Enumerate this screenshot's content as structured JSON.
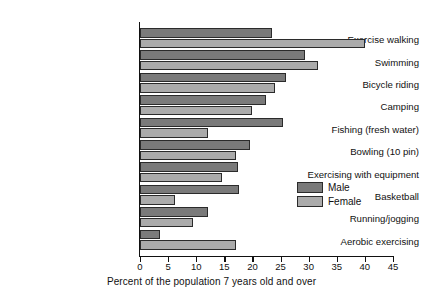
{
  "chart_data": {
    "type": "bar",
    "orientation": "horizontal",
    "title": "",
    "xlabel": "Percent of the population 7 years old and over",
    "ylabel": "",
    "xlim": [
      0,
      45
    ],
    "xticks": [
      0,
      5,
      10,
      15,
      20,
      25,
      30,
      35,
      40,
      45
    ],
    "grid": false,
    "legend_position": "center-right",
    "categories": [
      "Exercise walking",
      "Swimming",
      "Bicycle riding",
      "Camping",
      "Fishing (fresh water)",
      "Bowling (10 pin)",
      "Exercising with equipment",
      "Basketball",
      "Running/jogging",
      "Aerobic exercising"
    ],
    "series": [
      {
        "name": "Male",
        "color": "#7a7a7a",
        "values": [
          23.5,
          29.4,
          26.0,
          22.4,
          25.4,
          19.6,
          17.4,
          17.6,
          12.1,
          3.6
        ]
      },
      {
        "name": "Female",
        "color": "#ababab",
        "values": [
          40.0,
          31.7,
          24.0,
          19.9,
          12.1,
          17.1,
          14.6,
          6.3,
          9.4,
          17.1
        ]
      }
    ]
  }
}
